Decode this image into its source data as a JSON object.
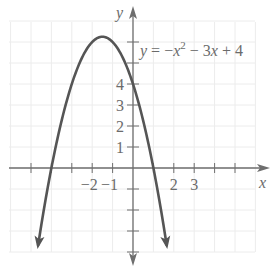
{
  "chart_data": {
    "type": "line",
    "title": "",
    "equation_label": "y = −x² − 3x + 4",
    "equation_parts": {
      "lhs": "y",
      "eq": " = −",
      "x1": "x",
      "sup": "2",
      "mid": " − 3",
      "x2": "x",
      "tail": " + 4"
    },
    "xlabel": "x",
    "ylabel": "y",
    "x_tick_labels": [
      "−2",
      "−1",
      "2",
      "3"
    ],
    "x_tick_label_values": [
      -2,
      -1,
      2,
      3
    ],
    "y_tick_labels": [
      "1",
      "2",
      "3",
      "4"
    ],
    "y_tick_label_values": [
      1,
      2,
      3,
      4
    ],
    "xlim": [
      -6,
      6
    ],
    "ylim": [
      -4.5,
      7.5
    ],
    "grid": true,
    "series": [
      {
        "name": "y = -x^2 - 3x + 4",
        "function": "-x^2 - 3x + 4",
        "domain": [
          -4.65,
          1.65
        ],
        "vertex": [
          -1.5,
          6.25
        ],
        "x_intercepts": [
          -4,
          1
        ],
        "y_intercept": 4,
        "x": [
          -4.65,
          -4,
          -3,
          -2,
          -1.5,
          -1,
          0,
          1,
          1.65
        ],
        "values": [
          -3.67,
          0,
          4,
          6,
          6.25,
          6,
          4,
          0,
          -3.67
        ],
        "arrows_at_ends": true
      }
    ]
  },
  "colors": {
    "curve": "#555555",
    "axis": "#6e6e6e",
    "grid": "#ececec",
    "text": "#6b6b6b"
  }
}
